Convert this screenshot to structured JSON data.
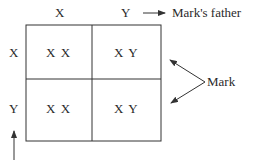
{
  "diagram": {
    "type": "punnett-square",
    "column_headers": [
      "X",
      "Y"
    ],
    "row_headers": [
      "X",
      "Y"
    ],
    "cells": [
      [
        "X X",
        "X Y"
      ],
      [
        "X X",
        "X Y"
      ]
    ],
    "labels": {
      "father": "Mark's father",
      "mark": "Mark"
    },
    "colors": {
      "line": "#333333",
      "text": "#2a2a2a",
      "background": "#ffffff"
    }
  }
}
